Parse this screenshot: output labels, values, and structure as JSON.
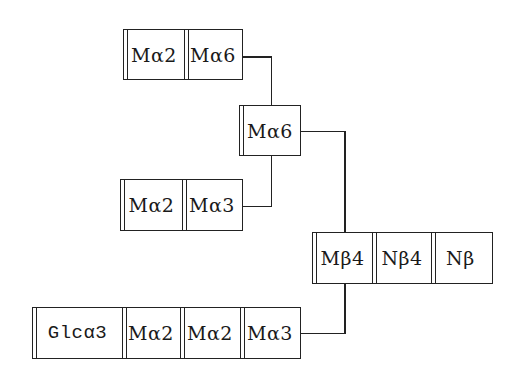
{
  "diagram": {
    "type": "glycan-structure",
    "colors": {
      "stroke": "#222222",
      "background": "#ffffff",
      "text": "#1a1a1a"
    },
    "branches": {
      "upper_arm": {
        "residues": [
          {
            "label": "Mα2",
            "x": 123,
            "y": 29,
            "w": 61,
            "h": 51
          },
          {
            "label": "Mα6",
            "x": 184,
            "y": 29,
            "w": 58,
            "h": 51
          }
        ]
      },
      "branch_node": {
        "residues": [
          {
            "label": "Mα6",
            "x": 239,
            "y": 105,
            "w": 62,
            "h": 51
          }
        ]
      },
      "middle_arm": {
        "residues": [
          {
            "label": "Mα2",
            "x": 120,
            "y": 179,
            "w": 62,
            "h": 52
          },
          {
            "label": "Mα3",
            "x": 182,
            "y": 179,
            "w": 60,
            "h": 52
          }
        ]
      },
      "core": {
        "residues": [
          {
            "label": "Mβ4",
            "x": 312,
            "y": 232,
            "w": 60,
            "h": 52
          },
          {
            "label": "Nβ4",
            "x": 372,
            "y": 232,
            "w": 60,
            "h": 52
          },
          {
            "label": "Nβ",
            "x": 432,
            "y": 232,
            "w": 61,
            "h": 52
          }
        ]
      },
      "lower_arm": {
        "residues": [
          {
            "label": "Glcα3",
            "x": 32,
            "y": 307,
            "w": 90,
            "h": 52
          },
          {
            "label": "Mα2",
            "x": 122,
            "y": 307,
            "w": 58,
            "h": 52
          },
          {
            "label": "Mα2",
            "x": 180,
            "y": 307,
            "w": 60,
            "h": 52
          },
          {
            "label": "Mα3",
            "x": 240,
            "y": 307,
            "w": 60,
            "h": 52
          }
        ]
      }
    },
    "connectors": [
      {
        "from": "upper_arm.Mα6",
        "to": "branch_node.Mα6"
      },
      {
        "from": "middle_arm.Mα3",
        "to": "branch_node.Mα6"
      },
      {
        "from": "branch_node.Mα6",
        "to": "core.Mβ4"
      },
      {
        "from": "lower_arm.Mα3",
        "to": "core.Mβ4"
      }
    ]
  }
}
